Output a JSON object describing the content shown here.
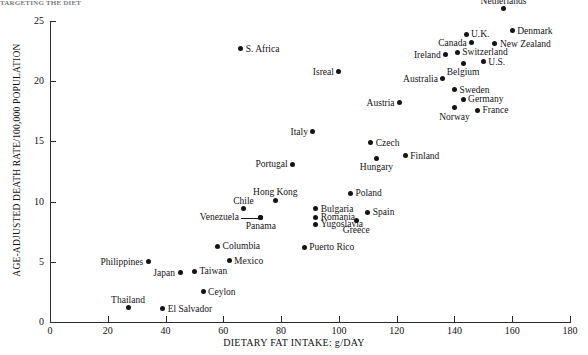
{
  "figure": {
    "top_strip_text": "TARGETING THE DIET",
    "xlabel": "DIETARY FAT INTAKE: g/DAY",
    "ylabel": "AGE-ADJUSTED DEATH RATE/100,000 POPULATION",
    "point_color": "#141414",
    "axis_color": "#2a2a2a",
    "background": "#ffffff"
  },
  "chart_data": {
    "type": "scatter",
    "title": "",
    "xlabel": "DIETARY FAT INTAKE: g/DAY",
    "ylabel": "AGE-ADJUSTED DEATH RATE/100,000 POPULATION",
    "xlim": [
      0,
      180
    ],
    "ylim": [
      0,
      25
    ],
    "xticks": [
      0,
      20,
      40,
      60,
      80,
      100,
      120,
      140,
      160,
      180
    ],
    "yticks": [
      0,
      5,
      10,
      15,
      20,
      25
    ],
    "grid": false,
    "legend": null,
    "points": [
      {
        "label": "Netherlands",
        "x": 157,
        "y": 26.0,
        "label_pos": "above"
      },
      {
        "label": "Denmark",
        "x": 160,
        "y": 24.2,
        "label_pos": "right"
      },
      {
        "label": "U.K.",
        "x": 144,
        "y": 23.9,
        "label_pos": "right"
      },
      {
        "label": "Canada",
        "x": 146,
        "y": 23.2,
        "label_pos": "left"
      },
      {
        "label": "New Zealand",
        "x": 154,
        "y": 23.1,
        "label_pos": "right"
      },
      {
        "label": "Switzerland",
        "x": 141,
        "y": 22.4,
        "label_pos": "right"
      },
      {
        "label": "Ireland",
        "x": 137,
        "y": 22.2,
        "label_pos": "left"
      },
      {
        "label": "U.S.",
        "x": 150,
        "y": 21.6,
        "label_pos": "right"
      },
      {
        "label": "Belgium",
        "x": 143,
        "y": 21.5,
        "label_pos": "below"
      },
      {
        "label": "S. Africa",
        "x": 66,
        "y": 22.7,
        "label_pos": "right"
      },
      {
        "label": "Isreal",
        "x": 100,
        "y": 20.8,
        "label_pos": "left"
      },
      {
        "label": "Australia",
        "x": 136,
        "y": 20.2,
        "label_pos": "left"
      },
      {
        "label": "Sweden",
        "x": 140,
        "y": 19.3,
        "label_pos": "right"
      },
      {
        "label": "Germany",
        "x": 143,
        "y": 18.5,
        "label_pos": "right"
      },
      {
        "label": "Austria",
        "x": 121,
        "y": 18.2,
        "label_pos": "left"
      },
      {
        "label": "Norway",
        "x": 140,
        "y": 17.8,
        "label_pos": "below"
      },
      {
        "label": "France",
        "x": 148,
        "y": 17.6,
        "label_pos": "right"
      },
      {
        "label": "Italy",
        "x": 91,
        "y": 15.8,
        "label_pos": "left"
      },
      {
        "label": "Czech",
        "x": 111,
        "y": 14.9,
        "label_pos": "right"
      },
      {
        "label": "Finland",
        "x": 123,
        "y": 13.8,
        "label_pos": "right"
      },
      {
        "label": "Hungary",
        "x": 113,
        "y": 13.6,
        "label_pos": "below"
      },
      {
        "label": "Portugal",
        "x": 84,
        "y": 13.1,
        "label_pos": "left"
      },
      {
        "label": "Poland",
        "x": 104,
        "y": 10.7,
        "label_pos": "right"
      },
      {
        "label": "Hong Kong",
        "x": 78,
        "y": 10.1,
        "label_pos": "above"
      },
      {
        "label": "Bulgaria",
        "x": 92,
        "y": 9.4,
        "label_pos": "right"
      },
      {
        "label": "Chile",
        "x": 67,
        "y": 9.4,
        "label_pos": "above"
      },
      {
        "label": "Spain",
        "x": 110,
        "y": 9.1,
        "label_pos": "right"
      },
      {
        "label": "Romania",
        "x": 92,
        "y": 8.7,
        "label_pos": "right"
      },
      {
        "label": "Panama",
        "x": 73,
        "y": 8.7,
        "label_pos": "below"
      },
      {
        "label": "Venezuela",
        "x": 73,
        "y": 8.7,
        "label_pos": "leader-left"
      },
      {
        "label": "Greece",
        "x": 106,
        "y": 8.4,
        "label_pos": "below"
      },
      {
        "label": "Yugoslavia",
        "x": 92,
        "y": 8.1,
        "label_pos": "right"
      },
      {
        "label": "Columbia",
        "x": 58,
        "y": 6.3,
        "label_pos": "right"
      },
      {
        "label": "Puerto Rico",
        "x": 88,
        "y": 6.2,
        "label_pos": "right"
      },
      {
        "label": "Mexico",
        "x": 62,
        "y": 5.1,
        "label_pos": "right"
      },
      {
        "label": "Philippines",
        "x": 34,
        "y": 5.0,
        "label_pos": "left"
      },
      {
        "label": "Taiwan",
        "x": 50,
        "y": 4.2,
        "label_pos": "right"
      },
      {
        "label": "Japan",
        "x": 45,
        "y": 4.1,
        "label_pos": "left"
      },
      {
        "label": "Ceylon",
        "x": 53,
        "y": 2.5,
        "label_pos": "right"
      },
      {
        "label": "Thailand",
        "x": 27,
        "y": 1.2,
        "label_pos": "above"
      },
      {
        "label": "El Salvador",
        "x": 39,
        "y": 1.1,
        "label_pos": "right"
      }
    ]
  }
}
